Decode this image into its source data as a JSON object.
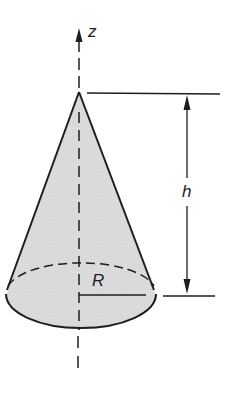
{
  "diagram": {
    "type": "cone",
    "colors": {
      "stroke": "#1e1e1e",
      "fill": "#d9d9d9",
      "background": "#ffffff"
    },
    "labels": {
      "axis": "z",
      "height": "h",
      "radius": "R"
    }
  }
}
